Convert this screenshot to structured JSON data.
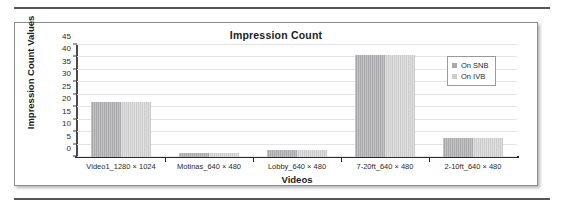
{
  "figure": {
    "has_top_rule": true,
    "has_bottom_rule": true,
    "frame_border_color": "#8d8d90"
  },
  "chart_data": {
    "type": "bar",
    "title": "Impression Count",
    "xlabel": "Videos",
    "ylabel": "Impression Count Values",
    "categories": [
      "Video1_1280 × 1024",
      "Motinas_640 × 480",
      "Lobby_640 × 480",
      "7-20ft_640 × 480",
      "2-10ft_640 × 480"
    ],
    "series": [
      {
        "name": "On SNB",
        "color": "#a9a9ab",
        "values": [
          22,
          1.5,
          3,
          41,
          7.5
        ]
      },
      {
        "name": "On IVB",
        "color": "#cccccd",
        "values": [
          22,
          1.5,
          3,
          41,
          7.5
        ]
      }
    ],
    "ylim": [
      0,
      45
    ],
    "yticks": [
      0,
      5,
      10,
      15,
      20,
      25,
      30,
      35,
      40,
      45
    ],
    "ytick_labels": [
      "0",
      "5",
      "10",
      "15",
      "20",
      "25",
      "30",
      "35",
      "40",
      "45"
    ],
    "grid": true,
    "grid_color": "#e3e3ea",
    "legend_position": "upper-right",
    "legend_entries": [
      "On SNB",
      "On IVB"
    ]
  }
}
